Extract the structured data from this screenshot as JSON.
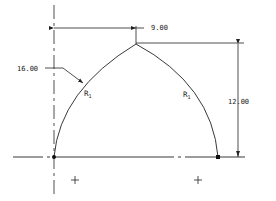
{
  "drawing": {
    "type": "gothic-arch-sketch",
    "colors": {
      "line": "#222222",
      "background": "#ffffff"
    },
    "dimensions": {
      "horizontal": {
        "value": "9.00"
      },
      "vertical": {
        "value": "12.00"
      },
      "radius_callout": {
        "value": "16.00"
      }
    },
    "labels": {
      "left_arc": {
        "main": "R",
        "sub": "1"
      },
      "right_arc": {
        "main": "R",
        "sub": "1"
      }
    },
    "markers": [
      {
        "name": "origin-point",
        "shape": "dot"
      },
      {
        "name": "right-endpoint",
        "shape": "square"
      },
      {
        "name": "left-center-plus",
        "shape": "plus"
      },
      {
        "name": "right-center-plus",
        "shape": "plus"
      }
    ]
  }
}
